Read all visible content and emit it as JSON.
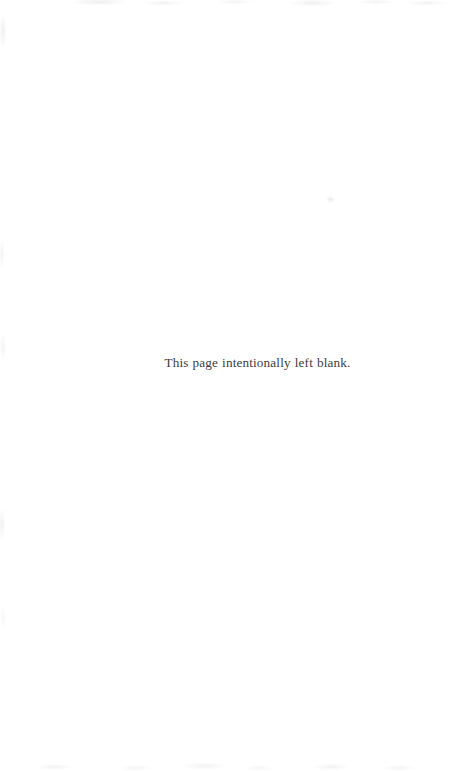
{
  "page": {
    "background_color": "#ffffff",
    "ink_color": "#3d3d3d",
    "width": 453,
    "height": 771,
    "body_text": "This page intentionally left blank."
  },
  "artifacts": {
    "top_edge_name": "scan-speckle-top",
    "left_edge_name": "scan-shading-left",
    "bottom_edge_name": "scan-speckle-bottom",
    "speck_name": "scan-speck-upper-right"
  }
}
